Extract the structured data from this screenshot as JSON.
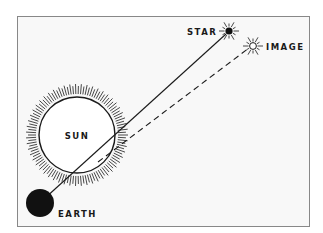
{
  "diagram": {
    "labels": {
      "star": "STAR",
      "image": "IMAGE",
      "sun": "SUN",
      "earth": "EARTH"
    },
    "colors": {
      "background": "#ffffff",
      "frame_fill": "#f8f8f8",
      "frame_border": "#888888",
      "ink": "#1a1a1a"
    },
    "elements": {
      "sun": {
        "cx": 77,
        "cy": 135,
        "r": 38,
        "corona_outer_r": 51
      },
      "earth": {
        "cx": 40,
        "cy": 203,
        "r": 14
      },
      "star": {
        "cx": 229,
        "cy": 31
      },
      "image": {
        "cx": 253,
        "cy": 46
      },
      "true_path": "solid line Earth to Star",
      "apparent_path": "dashed line from Sun limb to Image"
    }
  }
}
